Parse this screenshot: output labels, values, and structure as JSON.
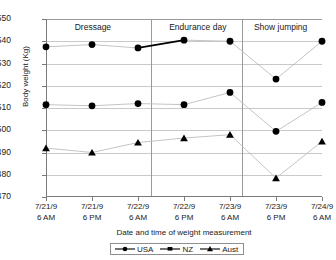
{
  "chart_data": {
    "type": "line",
    "title": "",
    "xlabel": "Date and time of weight measurement",
    "ylabel": "Body weight (Kg)",
    "ylim": [
      470,
      550
    ],
    "ytick_step": 10,
    "yticks": [
      "550",
      "540",
      "530",
      "520",
      "510",
      "500",
      "490",
      "480",
      "470"
    ],
    "grid": true,
    "legend_position": "bottom",
    "categories": [
      "7/21/9 6 AM",
      "7/21/9 6 PM",
      "7/22/9 6 AM",
      "7/22/9 6 PM",
      "7/23/9 6 AM",
      "7/23/9 6 PM",
      "7/24/9 6 AM"
    ],
    "xtick_labels": [
      {
        "line1": "7/21/9",
        "line2": "6 AM"
      },
      {
        "line1": "7/21/9",
        "line2": "6 PM"
      },
      {
        "line1": "7/22/9",
        "line2": "6 AM"
      },
      {
        "line1": "7/22/9",
        "line2": "6 PM"
      },
      {
        "line1": "7/23/9",
        "line2": "6 AM"
      },
      {
        "line1": "7/23/9",
        "line2": "6 PM"
      },
      {
        "line1": "7/24/9",
        "line2": "6 AM"
      }
    ],
    "series": [
      {
        "name": "USA",
        "marker": "circle",
        "values": [
          537.5,
          538.5,
          537.0,
          540.5,
          540.0,
          523.0,
          540.0
        ]
      },
      {
        "name": "NZ",
        "marker": "circle",
        "values": [
          511.5,
          511.0,
          512.0,
          511.5,
          517.0,
          499.5,
          512.5
        ]
      },
      {
        "name": "Aust",
        "marker": "triangle",
        "values": [
          492.0,
          490.0,
          494.5,
          496.5,
          498.0,
          478.5,
          495.0
        ]
      }
    ],
    "annotations": [
      {
        "text": "Dressage",
        "at_x_fraction": 0.17
      },
      {
        "text": "Endurance day",
        "at_x_fraction": 0.55
      },
      {
        "text": "Show jumping",
        "at_x_fraction": 0.85
      }
    ],
    "dividers_x_fraction": [
      0.375,
      0.705
    ],
    "colors": {
      "marker": "#000000",
      "line": "#bdbdbd",
      "line_highlight": "#000000",
      "grid": "#c9c9c9",
      "axis": "#7b7b7b",
      "text": "#1a1a1a"
    }
  },
  "legend": {
    "items": [
      {
        "label": "USA"
      },
      {
        "label": "NZ"
      },
      {
        "label": "Aust"
      }
    ]
  }
}
